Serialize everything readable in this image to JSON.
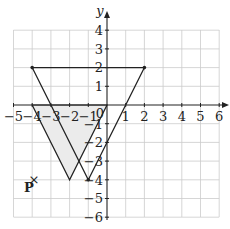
{
  "diagram": {
    "axes": {
      "x_label": "x",
      "y_label": "y",
      "x_range": [
        -5,
        6
      ],
      "y_range": [
        -6,
        4
      ],
      "x_ticks": [
        "−5",
        "−4",
        "−3",
        "−2",
        "−1",
        "1",
        "2",
        "3",
        "4",
        "5",
        "6"
      ],
      "y_ticks_pos": [
        "4",
        "3",
        "2",
        "1"
      ],
      "y_ticks_neg": [
        "−1",
        "−2",
        "−3",
        "−4",
        "−5",
        "−6"
      ],
      "origin_label": "0"
    },
    "triangle_object": {
      "label": "shaded triangle",
      "vertices": [
        [
          -4,
          0
        ],
        [
          0,
          0
        ],
        [
          -2,
          -4
        ]
      ],
      "fill": "#ebebeb"
    },
    "triangle_image": {
      "label": "larger triangle",
      "vertices": [
        [
          -4,
          2
        ],
        [
          2,
          2
        ],
        [
          -1,
          -4
        ]
      ]
    },
    "point": {
      "label": "P",
      "marker": "×",
      "coords": [
        -4,
        -4
      ]
    },
    "colors": {
      "grid": "#cccccc",
      "axis": "#222222",
      "line": "#222222",
      "shade": "#ebebeb"
    }
  }
}
